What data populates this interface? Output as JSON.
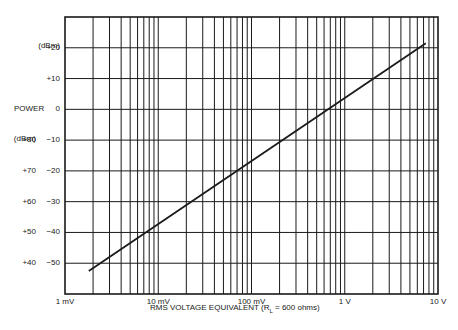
{
  "chart_data": {
    "type": "line",
    "title": "",
    "xlabel": "RMS VOLTAGE EQUIVALENT (RL = 600 ohms)",
    "xlabel_prefix": "RMS VOLTAGE EQUIVALENT (R",
    "xlabel_sub": "L",
    "xlabel_suffix": " = 600 ohms)",
    "ylabel": "POWER",
    "y_unit_dbm": "(dBm)",
    "y_unit_dbrn": "(dBrn)",
    "x_scale": "log",
    "x_ticks": [
      "1 mV",
      "10 mV",
      "100 mV",
      "1 V",
      "10 V"
    ],
    "x_range_volts": [
      0.001,
      10
    ],
    "y_ticks_dbm": [
      "+20",
      "+10",
      "0",
      "-10",
      "-20",
      "-30",
      "-40",
      "-50"
    ],
    "y_ticks_dbrn": [
      "+80",
      "+70",
      "+60",
      "+50",
      "+40"
    ],
    "ylim_dbm": [
      -60,
      30
    ],
    "grid": true,
    "series": [
      {
        "name": "Power vs RMS voltage (600 ohms)",
        "x_volts": [
          0.0018,
          7.4
        ],
        "y_dbm": [
          -52.5,
          21.5
        ]
      }
    ]
  }
}
